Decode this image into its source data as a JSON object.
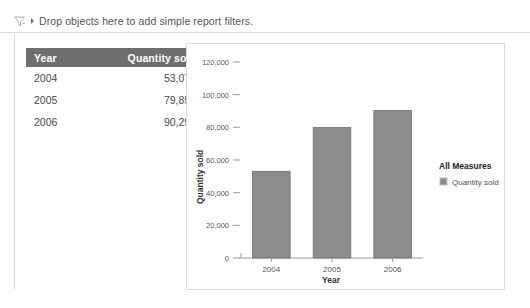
{
  "filter_bar": {
    "icon": "filter-funnel-icon",
    "caret": "chevron-down-icon",
    "text": "Drop objects here to add simple report filters."
  },
  "table": {
    "columns": [
      "Year",
      "Quantity sold"
    ],
    "rows": [
      [
        "2004",
        "53,078"
      ],
      [
        "2005",
        "79,855"
      ],
      [
        "2006",
        "90,296"
      ]
    ]
  },
  "chart_data": {
    "type": "bar",
    "title": "",
    "categories": [
      "2004",
      "2005",
      "2006"
    ],
    "values": [
      53078,
      79855,
      90296
    ],
    "series": [
      {
        "name": "Quantity sold",
        "values": [
          53078,
          79855,
          90296
        ]
      }
    ],
    "xlabel": "Year",
    "ylabel": "Quantity sold",
    "ylim": [
      0,
      120000
    ],
    "yticks": [
      0,
      20000,
      40000,
      60000,
      80000,
      100000,
      120000
    ],
    "ytick_labels": [
      "0",
      "20,000",
      "40,000",
      "60,000",
      "80,000",
      "100,000",
      "120,000"
    ],
    "grid": false,
    "legend_position": "right",
    "legend_title": "All Measures",
    "legend_entries": [
      "Quantity sold"
    ],
    "bar_color": "#8c8c8c",
    "bar_border_color": "#6f6f6f"
  }
}
